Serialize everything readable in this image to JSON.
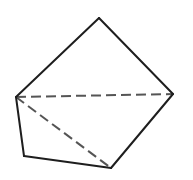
{
  "diagram": {
    "type": "geometric-figure",
    "colors": {
      "background": "#ffffff",
      "solid_edge": "#1e1e1e",
      "dashed_edge": "#555555"
    },
    "vertices": {
      "top": [
        99,
        18
      ],
      "left": [
        16,
        97
      ],
      "right": [
        173,
        94
      ],
      "bottom_left": [
        24,
        156
      ],
      "bottom": [
        111,
        168
      ]
    },
    "solid_edges": [
      [
        "top",
        "left"
      ],
      [
        "top",
        "right"
      ],
      [
        "right",
        "bottom"
      ],
      [
        "bottom",
        "bottom_left"
      ],
      [
        "bottom_left",
        "left"
      ]
    ],
    "dashed_edges": [
      [
        "left",
        "right"
      ],
      [
        "left",
        "bottom"
      ]
    ],
    "dash_pattern": "10,5",
    "stroke_width": 2
  }
}
